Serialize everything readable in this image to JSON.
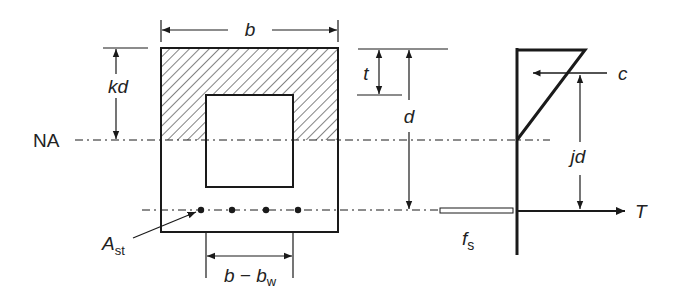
{
  "diagram": {
    "type": "reinforced concrete beam section with stress diagram",
    "colors": {
      "stroke": "#1a1a1a",
      "background": "#ffffff"
    },
    "labels": {
      "width": "b",
      "neutral_axis_depth": "kd",
      "neutral_axis": "NA",
      "flange_thickness": "t",
      "effective_depth": "d",
      "steel_area_main": "A",
      "steel_area_sub": "st",
      "web_gap_main": "b − b",
      "web_gap_sub": "w",
      "steel_stress_main": "f",
      "steel_stress_sub": "s",
      "compression_force": "c",
      "lever_arm": "jd",
      "tension_force": "T"
    }
  }
}
